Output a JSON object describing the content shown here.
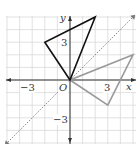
{
  "diagram": {
    "type": "coordinate-plane-reflection",
    "axes": {
      "x_label": "x",
      "y_label": "y",
      "origin_label": "O",
      "range": {
        "x": [
          -5,
          5
        ],
        "y": [
          -5,
          5
        ]
      },
      "tick_labels": {
        "x_neg": "−3",
        "x_pos": "3",
        "y_pos": "3",
        "y_neg": "−3"
      }
    },
    "grid": true,
    "reflection_line": {
      "equation": "y = x",
      "style": "dashed"
    },
    "original_triangle": {
      "vertices": [
        [
          0,
          0
        ],
        [
          -2,
          3
        ],
        [
          2,
          5
        ]
      ],
      "color": "#111111"
    },
    "image_triangle": {
      "vertices": [
        [
          0,
          0
        ],
        [
          3,
          -2
        ],
        [
          5,
          2
        ]
      ],
      "color": "#999999"
    },
    "colors": {
      "grid": "#d9d9d9",
      "axis": "#333333",
      "dashed_line": "#777777"
    }
  }
}
